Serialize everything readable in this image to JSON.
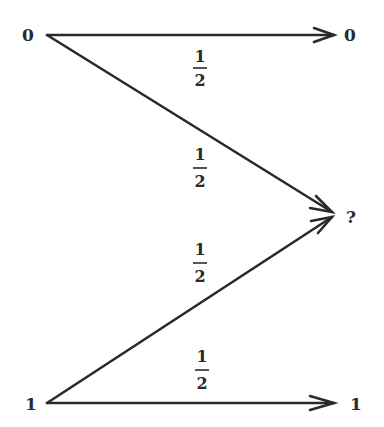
{
  "diagram": {
    "type": "binary-erasure-channel",
    "inputs": [
      {
        "id": "in0",
        "label": "0",
        "x": 30,
        "y": 40
      },
      {
        "id": "in1",
        "label": "1",
        "x": 30,
        "y": 409
      }
    ],
    "outputs": [
      {
        "id": "out0",
        "label": "0",
        "x": 349,
        "y": 40
      },
      {
        "id": "outE",
        "label": "?",
        "x": 350,
        "y": 223
      },
      {
        "id": "out1",
        "label": "1",
        "x": 353,
        "y": 409
      }
    ],
    "edges": [
      {
        "from": "in0",
        "to": "out0",
        "prob_num": "1",
        "prob_den": "2"
      },
      {
        "from": "in0",
        "to": "outE",
        "prob_num": "1",
        "prob_den": "2"
      },
      {
        "from": "in1",
        "to": "outE",
        "prob_num": "1",
        "prob_den": "2"
      },
      {
        "from": "in1",
        "to": "out1",
        "prob_num": "1",
        "prob_den": "2"
      }
    ],
    "stroke_color": "#2a2a2a"
  }
}
